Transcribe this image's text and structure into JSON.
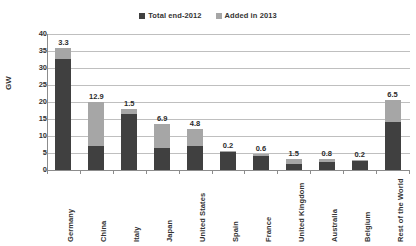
{
  "chart_data": {
    "type": "bar",
    "subtype": "stacked",
    "title": "",
    "xlabel": "",
    "ylabel": "GW",
    "ylim": [
      0,
      40
    ],
    "ytick_step": 5,
    "yticks": [
      "40",
      "35",
      "30",
      "25",
      "20",
      "15",
      "10",
      "5",
      "0"
    ],
    "grid": true,
    "legend_position": "top-center",
    "categories": [
      "Germany",
      "China",
      "Italy",
      "Japan",
      "United States",
      "Spain",
      "France",
      "United Kingdom",
      "Australia",
      "Belgium",
      "Rest of the World"
    ],
    "series": [
      {
        "name": "Total end-2012",
        "color": "#404040",
        "values": [
          32.7,
          7.1,
          16.4,
          6.6,
          7.2,
          5.4,
          4.0,
          1.8,
          2.4,
          2.7,
          14.0
        ]
      },
      {
        "name": "Added in 2013",
        "color": "#a6a6a6",
        "values": [
          3.3,
          12.9,
          1.5,
          6.9,
          4.8,
          0.2,
          0.6,
          1.5,
          0.8,
          0.2,
          6.5
        ]
      }
    ],
    "data_labels": [
      "3.3",
      "12.9",
      "1.5",
      "6.9",
      "4.8",
      "0.2",
      "0.6",
      "1.5",
      "0.8",
      "0.2",
      "6.5"
    ],
    "totals": [
      36.0,
      20.0,
      17.9,
      13.5,
      12.0,
      5.6,
      4.6,
      3.3,
      3.2,
      2.9,
      20.5
    ]
  },
  "legend": {
    "entries": [
      {
        "label": "Total end-2012",
        "color": "#404040"
      },
      {
        "label": "Added in 2013",
        "color": "#a6a6a6"
      }
    ]
  },
  "axes": {
    "y_title": "GW"
  }
}
